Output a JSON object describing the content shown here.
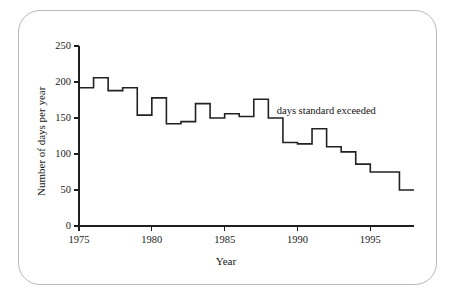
{
  "figure": {
    "frame_style": "rounded-rectangle",
    "background_color": "#ffffff",
    "border_color": "#b9b9b9"
  },
  "chart_data": {
    "type": "line",
    "subtype": "step",
    "title": "",
    "subtitle": "",
    "xlabel": "Year",
    "ylabel": "Number of days per year",
    "grid": false,
    "legend_position": "inline-annotation",
    "line_color": "#222222",
    "line_width": 1.6,
    "xlim": [
      1975,
      1998
    ],
    "ylim": [
      0,
      250
    ],
    "xticks": [
      1975,
      1980,
      1985,
      1990,
      1995
    ],
    "xtick_labels": [
      "1975",
      "1980",
      "1985",
      "1990",
      "1995"
    ],
    "yticks": [
      0,
      50,
      100,
      150,
      200,
      250
    ],
    "ytick_labels": [
      "0",
      "50",
      "100",
      "150",
      "200",
      "250"
    ],
    "annotations": [
      {
        "text": "days standard exceeded",
        "x": 1990.5,
        "y": 158
      }
    ],
    "series": [
      {
        "name": "days standard exceeded",
        "x": [
          1975,
          1976,
          1977,
          1978,
          1979,
          1980,
          1981,
          1982,
          1983,
          1984,
          1985,
          1986,
          1987,
          1988,
          1989,
          1990,
          1991,
          1992,
          1993,
          1994,
          1995,
          1996,
          1997
        ],
        "values": [
          192,
          206,
          188,
          192,
          154,
          178,
          142,
          145,
          170,
          150,
          156,
          152,
          176,
          150,
          116,
          114,
          135,
          110,
          103,
          86,
          75,
          75,
          50
        ]
      }
    ]
  },
  "axes": {
    "y_label_text": "Number of days per year",
    "x_label_text": "Year"
  }
}
